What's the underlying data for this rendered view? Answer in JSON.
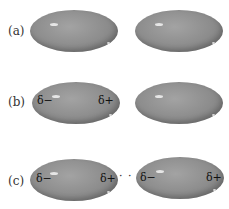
{
  "panels": [
    {
      "label": "(a)",
      "left_mol": {
        "charges": []
      },
      "right_mol": {
        "charges": []
      }
    },
    {
      "label": "(b)",
      "left_mol": {
        "neg": "δ−",
        "pos": "δ+"
      },
      "right_mol": {
        "charges": []
      }
    },
    {
      "label": "(c)",
      "left_mol": {
        "neg": "δ−",
        "pos": "δ+"
      },
      "right_mol": {
        "neg": "δ−",
        "pos": "δ+"
      },
      "interaction": "· · · ·"
    }
  ],
  "colors": {
    "molecule": "#8c8c8c",
    "highlight": "#e6e6e6",
    "text": "#111111"
  }
}
